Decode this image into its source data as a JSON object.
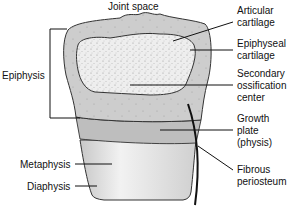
{
  "diagram": {
    "type": "anatomy-labeled-illustration",
    "labels": {
      "joint_space": "Joint space",
      "articular_cartilage": [
        "Articular",
        "cartilage"
      ],
      "epiphyseal_cartilage": [
        "Epiphyseal",
        "cartilage"
      ],
      "secondary_ossification": [
        "Secondary",
        "ossification",
        "center"
      ],
      "growth_plate": [
        "Growth",
        "plate",
        "(physis)"
      ],
      "fibrous_periosteum": [
        "Fibrous",
        "periosteum"
      ],
      "epiphysis": "Epiphysis",
      "metaphysis": "Metaphysis",
      "diaphysis": "Diaphysis"
    },
    "colors": {
      "cartilage": "#c9c9c9",
      "ossification": "#ececec",
      "growth_plate": "#bdbdbd",
      "shaft": "#e4e4e4",
      "outline": "#333333",
      "leader": "#111111"
    }
  }
}
